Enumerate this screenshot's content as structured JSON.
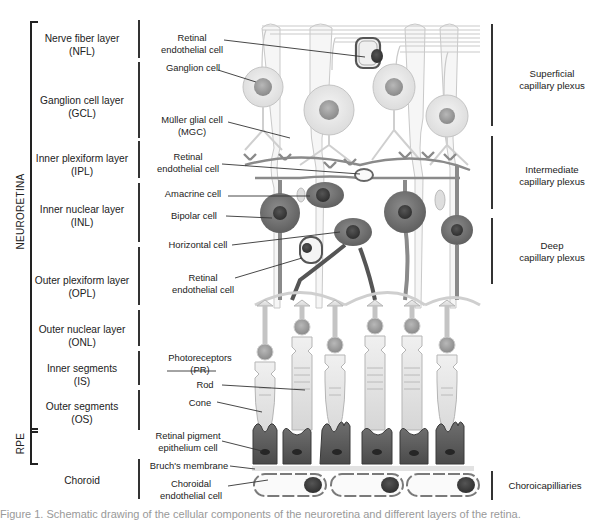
{
  "figure": {
    "group_labels": {
      "neuroretina": "NEURORETINA",
      "rpe": "RPE"
    },
    "layers": [
      {
        "name": "Nerve fiber layer",
        "abbr": "(NFL)"
      },
      {
        "name": "Ganglion cell layer",
        "abbr": "(GCL)"
      },
      {
        "name": "Inner plexiform layer",
        "abbr": "(IPL)"
      },
      {
        "name": "Inner nuclear layer",
        "abbr": "(INL)"
      },
      {
        "name": "Outer plexiform layer",
        "abbr": "(OPL)"
      },
      {
        "name": "Outer nuclear layer",
        "abbr": "(ONL)"
      },
      {
        "name": "Inner segments",
        "abbr": "(IS)"
      },
      {
        "name": "Outer segments",
        "abbr": "(OS)"
      },
      {
        "name": "Choroid",
        "abbr": ""
      }
    ],
    "cell_labels": {
      "retinal_endothelial_1": [
        "Retinal",
        "endothelial cell"
      ],
      "ganglion": "Ganglion cell",
      "muller": [
        "Müller glial cell",
        "(MGC)"
      ],
      "retinal_endothelial_2": [
        "Retinal",
        "endothelial cell"
      ],
      "amacrine": "Amacrine cell",
      "bipolar": "Bipolar cell",
      "horizontal": "Horizontal cell",
      "retinal_endothelial_3": [
        "Retinal",
        "endothelial cell"
      ],
      "photoreceptors": [
        "Photoreceptors",
        "(PR)"
      ],
      "rod": "Rod",
      "cone": "Cone",
      "rpe_cell": [
        "Retinal pigment",
        "epithelium cell"
      ],
      "bruchs": "Bruch's membrane",
      "choroidal_endothelial": [
        "Choroidal",
        "endothelial cell"
      ]
    },
    "plexus_labels": {
      "superficial": [
        "Superficial",
        "capillary plexus"
      ],
      "intermediate": [
        "Intermediate",
        "capillary plexus"
      ],
      "deep": [
        "Deep",
        "capillary plexus"
      ],
      "choroicapillaries": "Choroicapilliaries"
    },
    "caption": "Figure 1. Schematic drawing of the cellular components of the neuroretina and different layers of the retina."
  },
  "colors": {
    "line": "#333333",
    "cell_light": "#e8e8e8",
    "cell_outline": "#bdbdbd",
    "nucleus_light": "#9a9a9a",
    "cell_dark": "#6f6f6f",
    "nucleus_dark": "#3f3f3f",
    "rpe": "#5e5e5e",
    "vessel": "#8a8a8a"
  }
}
